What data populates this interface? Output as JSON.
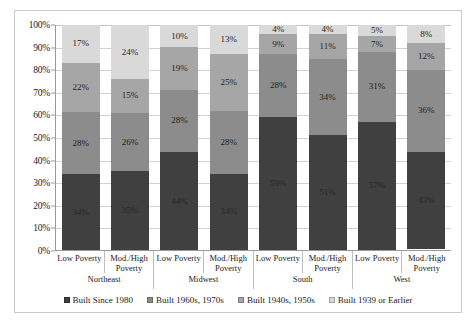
{
  "chart_data": {
    "type": "bar",
    "subtype": "stacked-bar-100",
    "title": "",
    "xlabel": "",
    "ylabel": "",
    "ylim": [
      0,
      100
    ],
    "grid": true,
    "legend_position": "bottom",
    "y_ticks": [
      "0%",
      "10%",
      "20%",
      "30%",
      "40%",
      "50%",
      "60%",
      "70%",
      "80%",
      "90%",
      "100%"
    ],
    "y_tick_values": [
      0,
      10,
      20,
      30,
      40,
      50,
      60,
      70,
      80,
      90,
      100
    ],
    "regions": [
      "Northeast",
      "Midwest",
      "South",
      "West"
    ],
    "categories": [
      "Low Poverty",
      "Mod./High Poverty",
      "Low Poverty",
      "Mod./High Poverty",
      "Low Poverty",
      "Mod./High Poverty",
      "Low Poverty",
      "Mod./High Poverty"
    ],
    "series": [
      {
        "name": "Built Since 1980",
        "color": "#404040",
        "values": [
          34,
          35,
          44,
          34,
          59,
          51,
          57,
          43
        ],
        "labels": [
          "34%",
          "35%",
          "44%",
          "34%",
          "59%",
          "51%",
          "57%",
          "43%"
        ]
      },
      {
        "name": "Built 1960s, 1970s",
        "color": "#8c8c8c",
        "values": [
          28,
          26,
          28,
          28,
          28,
          34,
          31,
          36
        ],
        "labels": [
          "28%",
          "26%",
          "28%",
          "28%",
          "28%",
          "34%",
          "31%",
          "36%"
        ]
      },
      {
        "name": "Built 1940s, 1950s",
        "color": "#a6a6a6",
        "values": [
          22,
          15,
          19,
          25,
          9,
          11,
          7,
          12
        ],
        "labels": [
          "22%",
          "15%",
          "19%",
          "25%",
          "9%",
          "11%",
          "7%",
          "12%"
        ]
      },
      {
        "name": "Built 1939 or Earlier",
        "color": "#d9d9d9",
        "values": [
          17,
          24,
          10,
          13,
          4,
          4,
          5,
          8
        ],
        "labels": [
          "17%",
          "24%",
          "10%",
          "13%",
          "4%",
          "4%",
          "5%",
          "8%"
        ]
      }
    ],
    "groups": [
      {
        "region": "Northeast",
        "bars": [
          {
            "category": "Low Poverty",
            "stack": [
              34,
              28,
              22,
              17
            ],
            "labels": [
              "34%",
              "28%",
              "22%",
              "17%"
            ]
          },
          {
            "category": "Mod./High Poverty",
            "stack": [
              35,
              26,
              15,
              24
            ],
            "labels": [
              "35%",
              "26%",
              "15%",
              "24%"
            ]
          }
        ]
      },
      {
        "region": "Midwest",
        "bars": [
          {
            "category": "Low Poverty",
            "stack": [
              44,
              28,
              19,
              10
            ],
            "labels": [
              "44%",
              "28%",
              "19%",
              "10%"
            ]
          },
          {
            "category": "Mod./High Poverty",
            "stack": [
              34,
              28,
              25,
              13
            ],
            "labels": [
              "34%",
              "28%",
              "25%",
              "13%"
            ]
          }
        ]
      },
      {
        "region": "South",
        "bars": [
          {
            "category": "Low Poverty",
            "stack": [
              59,
              28,
              9,
              4
            ],
            "labels": [
              "59%",
              "28%",
              "9%",
              "4%"
            ]
          },
          {
            "category": "Mod./High Poverty",
            "stack": [
              51,
              34,
              11,
              4
            ],
            "labels": [
              "51%",
              "34%",
              "11%",
              "4%"
            ]
          }
        ]
      },
      {
        "region": "West",
        "bars": [
          {
            "category": "Low Poverty",
            "stack": [
              57,
              31,
              7,
              5
            ],
            "labels": [
              "57%",
              "31%",
              "7%",
              "5%"
            ]
          },
          {
            "category": "Mod./High Poverty",
            "stack": [
              43,
              36,
              12,
              8
            ],
            "labels": [
              "43%",
              "36%",
              "12%",
              "8%"
            ]
          }
        ]
      }
    ],
    "legend": [
      {
        "label": "Built Since 1980",
        "color": "#404040"
      },
      {
        "label": "Built 1960s, 1970s",
        "color": "#8c8c8c"
      },
      {
        "label": "Built 1940s, 1950s",
        "color": "#a6a6a6"
      },
      {
        "label": "Built 1939 or Earlier",
        "color": "#d9d9d9"
      }
    ]
  }
}
